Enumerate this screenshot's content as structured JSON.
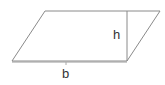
{
  "diagram": {
    "shape": "parallelogram",
    "labels": {
      "height": "h",
      "base": "b"
    },
    "colors": {
      "stroke": "#8a8a8a",
      "text": "#333333",
      "background": "#ffffff"
    }
  }
}
